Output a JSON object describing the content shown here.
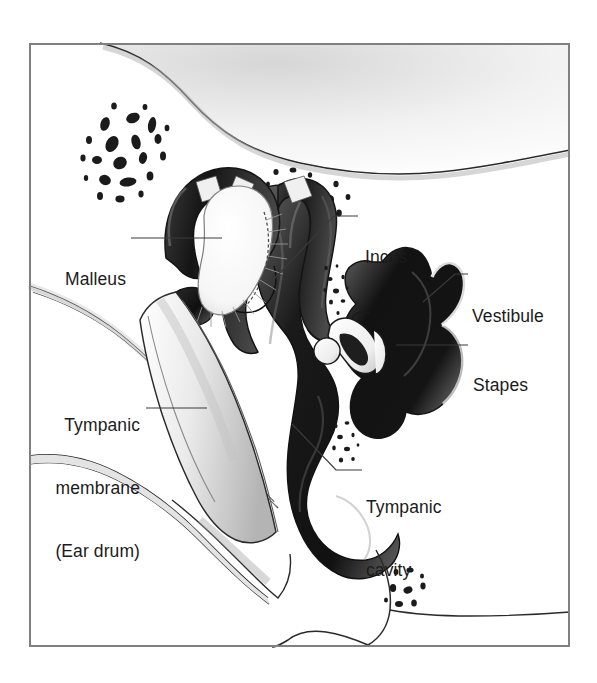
{
  "figure": {
    "frame": {
      "border_color": "#808080",
      "border_width_px": 2,
      "left": 29,
      "top": 43,
      "width": 541,
      "height": 604
    },
    "background_color": "#ffffff",
    "ink_color": "#1b1b1b",
    "bone_fill_dark": "#1a1a1a",
    "bone_fill_light": "#d8d8d8",
    "membrane_fill": "#d0d0d0"
  },
  "labels": [
    {
      "id": "malleus",
      "name": "Malleus",
      "lines": [
        "Malleus"
      ],
      "align": "right",
      "x": 57,
      "y": 227,
      "leader": {
        "type": "horizontal",
        "points": "131,238 222,238"
      }
    },
    {
      "id": "incus",
      "name": "Incus",
      "lines": [
        "Incus"
      ],
      "align": "left",
      "x": 365,
      "y": 205,
      "leader": {
        "type": "elbow",
        "points": "272,281 334,216 358,216"
      }
    },
    {
      "id": "vestibule",
      "name": "Vestibule",
      "lines": [
        "Vestibule"
      ],
      "align": "left",
      "x": 472,
      "y": 264,
      "leader": {
        "type": "elbow",
        "points": "423,302 455,274 468,274"
      }
    },
    {
      "id": "stapes",
      "name": "Stapes",
      "lines": [
        "Stapes"
      ],
      "align": "left",
      "x": 473,
      "y": 333,
      "leader": {
        "type": "horizontal",
        "points": "396,345 468,345"
      }
    },
    {
      "id": "tympanic-membrane",
      "name": "Tympanic membrane (Ear drum)",
      "lines": [
        "Tympanic",
        "membrane",
        "(Ear drum)"
      ],
      "align": "right",
      "x": 52,
      "y": 373,
      "leader": {
        "type": "horizontal",
        "points": "146,408 207,408"
      }
    },
    {
      "id": "tympanic-cavity",
      "name": "Tympanic cavity",
      "lines": [
        "Tympanic",
        "cavity"
      ],
      "align": "left",
      "x": 366,
      "y": 455,
      "leader": {
        "type": "elbow",
        "points": "292,424 336,470 362,470"
      }
    }
  ],
  "structures": [
    {
      "id": "temporal-bone-upper",
      "name": "Temporal bone (upper contour)"
    },
    {
      "id": "mastoid-stipple-left",
      "name": "Mastoid air cell stipple (left)"
    },
    {
      "id": "mastoid-stipple-right",
      "name": "Mastoid air cell stipple (right)"
    },
    {
      "id": "malleus-bone",
      "name": "Malleus ossicle"
    },
    {
      "id": "incus-bone",
      "name": "Incus ossicle"
    },
    {
      "id": "stapes-bone",
      "name": "Stapes ossicle (stirrup)"
    },
    {
      "id": "tympanic-membrane-shape",
      "name": "Tympanic membrane cone"
    },
    {
      "id": "tympanic-cavity-shape",
      "name": "Tympanic cavity space"
    },
    {
      "id": "vestibule-shape",
      "name": "Vestibule of inner ear"
    },
    {
      "id": "ear-canal",
      "name": "External auditory canal"
    },
    {
      "id": "stipple-lower",
      "name": "Bone stipple (lower right)"
    },
    {
      "id": "stipple-mid",
      "name": "Bone stipple (mid cavity)"
    }
  ]
}
